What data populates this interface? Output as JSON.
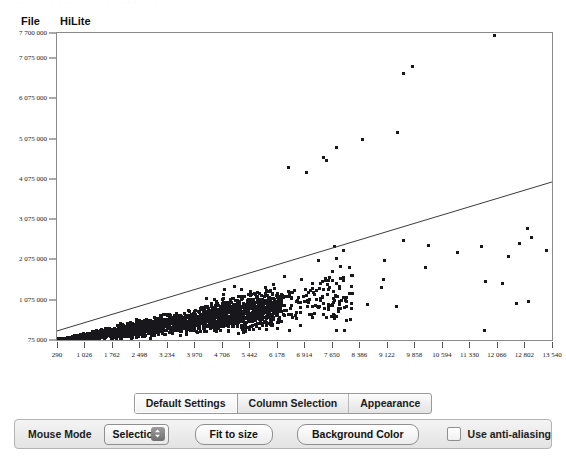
{
  "window": {
    "ghost_strip_text": "· · · · · · · · · · · · · · · · · · · · · · ·"
  },
  "menubar": {
    "items": [
      {
        "label": "File",
        "name": "menu-file"
      },
      {
        "label": "HiLite",
        "name": "menu-hilite"
      }
    ]
  },
  "tabstrip": {
    "tabs": [
      {
        "label": "Default Settings",
        "active": true
      },
      {
        "label": "Column Selection",
        "active": false
      },
      {
        "label": "Appearance",
        "active": false
      }
    ]
  },
  "bottombar": {
    "mouse_mode_label": "Mouse Mode",
    "mouse_mode_value": "Selection",
    "mouse_mode_options": [
      "Selection"
    ],
    "fit_to_size_label": "Fit to size",
    "background_color_label": "Background Color",
    "antialias_label": "Use anti-aliasing",
    "antialias_checked": false
  },
  "colors": {
    "point": "#17171c",
    "trend_line": "#3a3a3a",
    "plot_border": "#8a8a8a",
    "panel": "#ececec"
  },
  "chart_data": {
    "type": "scatter",
    "title": "",
    "xlabel": "",
    "ylabel": "",
    "grid": false,
    "legend": "none",
    "xlim": [
      290,
      13540
    ],
    "ylim": [
      75000,
      7700000
    ],
    "xticks": [
      290,
      1026,
      1762,
      2498,
      3234,
      3970,
      4706,
      5442,
      6178,
      6914,
      7650,
      8386,
      9122,
      9858,
      10594,
      11330,
      12066,
      12802,
      13540
    ],
    "xticklabels": [
      "290",
      "1 026",
      "1 762",
      "2 498",
      "3 234",
      "3 970",
      "4 706",
      "5 442",
      "6 178",
      "6 914",
      "7 650",
      "8 386",
      "9 122",
      "9 858",
      "10 594",
      "11 330",
      "12 066",
      "12 802",
      "13 540"
    ],
    "yticks": [
      75000,
      1075000,
      2075000,
      3075000,
      4075000,
      5075000,
      6075000,
      7075000,
      7700000
    ],
    "yticklabels": [
      "75 000",
      "1 075 000",
      "2 075 000",
      "3 075 000",
      "4 075 000",
      "5 075 000",
      "6 075 000",
      "7 075 000",
      "7 700 000"
    ],
    "marker": "square",
    "marker_size_px": 3,
    "n_points_approx": 2400,
    "trend_line": {
      "x0": 290,
      "y0": 300000,
      "x1": 13540,
      "y1": 4000000
    },
    "notable_outliers": [
      {
        "x": 12000,
        "y": 7660000
      },
      {
        "x": 9780,
        "y": 6870000
      },
      {
        "x": 9560,
        "y": 6700000
      },
      {
        "x": 9380,
        "y": 5250000
      },
      {
        "x": 8460,
        "y": 5060000
      },
      {
        "x": 7760,
        "y": 4880000
      },
      {
        "x": 7400,
        "y": 4620000
      },
      {
        "x": 7500,
        "y": 4540000
      },
      {
        "x": 6960,
        "y": 4250000
      },
      {
        "x": 6480,
        "y": 4380000
      },
      {
        "x": 13380,
        "y": 2320000
      },
      {
        "x": 7580,
        "y": 1400000
      }
    ]
  }
}
